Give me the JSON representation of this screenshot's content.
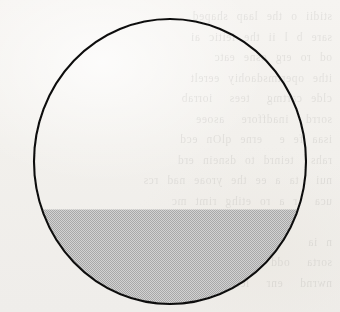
{
  "figure": {
    "caption": "",
    "type": "geometry-diagram",
    "background_color": "#f2f0ec",
    "ink_color": "#111111",
    "shade_color": "#bdbdbd",
    "shade_pattern": "halftone-checker-dots"
  },
  "circle": {
    "center_x": 170,
    "center_y": 161.5,
    "radius_x": 136,
    "radius_y": 142.5,
    "stroke_width": 2.1,
    "stroke_color": "#111111",
    "fill_color": "none"
  },
  "chord_line": {
    "y": 208.5,
    "x_start": 17,
    "x_end": 326,
    "stroke_width": 2.0,
    "stroke_color": "#111111",
    "left_intersection_x": 40,
    "right_intersection_x": 300
  },
  "shaded_segment": {
    "region": "lower-circular-segment",
    "top_y": 209.5,
    "bottom_y": 304,
    "fill_color": "#bdbdbd",
    "pattern_pitch_px": 2,
    "pattern_light": "#d2d2d2",
    "pattern_dark": "#a8a8a8"
  },
  "ghost_text": {
    "lines": "stidii o the laap shaped\nsare b l ii the ieitic ai\nod ro erg osne eatc\nithe opertmsdaohiy eerelt\nclde cartmg  tees  iorrab\nsorrd  inadffore  asoee\nisaa fe e  erne qlOn ecd\nrahs  teinrd to dsnein erd\nnui  ta a ee the yroae nad rcs\nuca  r a ro etihg rimt mc\n\nn ia\nsorta  odd  rae  ee\nnwrnd  enr  lesogu  raai"
  }
}
